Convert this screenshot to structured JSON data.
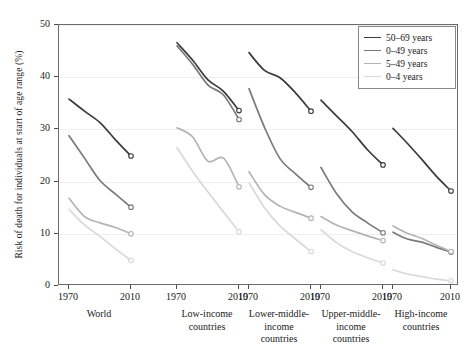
{
  "chart_data": {
    "type": "line",
    "title": "",
    "xlabel": "",
    "ylabel": "Risk of death for individuals at start of age range (%)",
    "ylim": [
      0,
      50
    ],
    "yticks": [
      0,
      10,
      20,
      30,
      40,
      50
    ],
    "ytick_labels": [
      "0",
      "10",
      "20",
      "30",
      "40",
      "50"
    ],
    "grid": true,
    "legend_position": "top-right",
    "x_range_per_group": [
      1970,
      2010
    ],
    "xtick_labels": [
      "1970",
      "2010"
    ],
    "groups": [
      {
        "name": "World",
        "label_lines": [
          "World"
        ],
        "series": [
          {
            "name": "50–69 years",
            "color": "#3b3b3b",
            "x": [
              1970,
              1980,
              1990,
              2000,
              2010
            ],
            "values": [
              35.8,
              33.5,
              31.3,
              28.0,
              24.9
            ]
          },
          {
            "name": "0–49 years",
            "color": "#7a7a7a",
            "x": [
              1970,
              1980,
              1990,
              2000,
              2010
            ],
            "values": [
              28.8,
              24.5,
              20.2,
              17.6,
              15.1
            ]
          },
          {
            "name": "5–49 years",
            "color": "#b4b4b4",
            "x": [
              1970,
              1980,
              1990,
              2000,
              2010
            ],
            "values": [
              16.8,
              13.3,
              12.1,
              11.2,
              10.0
            ]
          },
          {
            "name": "0–4 years",
            "color": "#d9d9d9",
            "x": [
              1970,
              1980,
              1990,
              2000,
              2010
            ],
            "values": [
              14.7,
              11.7,
              9.5,
              7.1,
              4.9
            ]
          }
        ]
      },
      {
        "name": "Low-income countries",
        "label_lines": [
          "Low-income",
          "countries"
        ],
        "series": [
          {
            "name": "50–69 years",
            "color": "#3b3b3b",
            "x": [
              1970,
              1980,
              1990,
              2000,
              2010
            ],
            "values": [
              46.6,
              43.3,
              39.5,
              37.3,
              33.6
            ]
          },
          {
            "name": "0–49 years",
            "color": "#7a7a7a",
            "x": [
              1970,
              1980,
              1990,
              2000,
              2010
            ],
            "values": [
              46.0,
              42.5,
              38.5,
              36.6,
              31.9
            ]
          },
          {
            "name": "5–49 years",
            "color": "#b4b4b4",
            "x": [
              1970,
              1980,
              1990,
              2000,
              2010
            ],
            "values": [
              30.3,
              28.6,
              23.9,
              24.5,
              19.0
            ]
          },
          {
            "name": "0–4 years",
            "color": "#d9d9d9",
            "x": [
              1970,
              1980,
              1990,
              2000,
              2010
            ],
            "values": [
              26.5,
              22.0,
              18.0,
              14.2,
              10.4
            ]
          }
        ]
      },
      {
        "name": "Lower-middle-income countries",
        "label_lines": [
          "Lower-middle-",
          "income",
          "countries"
        ],
        "series": [
          {
            "name": "50–69 years",
            "color": "#3b3b3b",
            "x": [
              1970,
              1980,
              1990,
              2000,
              2010
            ],
            "values": [
              44.7,
              41.3,
              39.9,
              37.0,
              33.5
            ]
          },
          {
            "name": "0–49 years",
            "color": "#7a7a7a",
            "x": [
              1970,
              1980,
              1990,
              2000,
              2010
            ],
            "values": [
              37.8,
              30.4,
              24.4,
              21.5,
              18.9
            ]
          },
          {
            "name": "5–49 years",
            "color": "#b4b4b4",
            "x": [
              1970,
              1980,
              1990,
              2000,
              2010
            ],
            "values": [
              21.9,
              17.5,
              15.3,
              14.1,
              13.0
            ]
          },
          {
            "name": "0–4 years",
            "color": "#d9d9d9",
            "x": [
              1970,
              1980,
              1990,
              2000,
              2010
            ],
            "values": [
              19.8,
              15.0,
              11.5,
              9.0,
              6.6
            ]
          }
        ]
      },
      {
        "name": "Upper-middle-income countries",
        "label_lines": [
          "Upper-middle-",
          "income",
          "countries"
        ],
        "series": [
          {
            "name": "50–69 years",
            "color": "#3b3b3b",
            "x": [
              1970,
              1980,
              1990,
              2000,
              2010
            ],
            "values": [
              35.6,
              32.6,
              29.6,
              26.1,
              23.2
            ]
          },
          {
            "name": "0–49 years",
            "color": "#7a7a7a",
            "x": [
              1970,
              1980,
              1990,
              2000,
              2010
            ],
            "values": [
              22.7,
              17.7,
              14.2,
              12.1,
              10.2
            ]
          },
          {
            "name": "5–49 years",
            "color": "#b4b4b4",
            "x": [
              1970,
              1980,
              1990,
              2000,
              2010
            ],
            "values": [
              13.3,
              11.7,
              10.6,
              9.6,
              8.7
            ]
          },
          {
            "name": "0–4 years",
            "color": "#d9d9d9",
            "x": [
              1970,
              1980,
              1990,
              2000,
              2010
            ],
            "values": [
              10.8,
              8.3,
              6.6,
              5.4,
              4.4
            ]
          }
        ]
      },
      {
        "name": "High-income countries",
        "label_lines": [
          "High-income",
          "countries"
        ],
        "series": [
          {
            "name": "50–69 years",
            "color": "#3b3b3b",
            "x": [
              1970,
              1980,
              1990,
              2000,
              2010
            ],
            "values": [
              30.2,
              27.3,
              24.2,
              21.0,
              18.2
            ]
          },
          {
            "name": "0–49 years",
            "color": "#7a7a7a",
            "x": [
              1970,
              1980,
              1990,
              2000,
              2010
            ],
            "values": [
              10.3,
              9.0,
              8.4,
              7.4,
              6.5
            ]
          },
          {
            "name": "5–49 years",
            "color": "#b4b4b4",
            "x": [
              1970,
              1980,
              1990,
              2000,
              2010
            ],
            "values": [
              11.5,
              10.1,
              9.1,
              7.8,
              6.6
            ]
          },
          {
            "name": "0–4 years",
            "color": "#d9d9d9",
            "x": [
              1970,
              1980,
              1990,
              2000,
              2010
            ],
            "values": [
              3.1,
              2.3,
              1.8,
              1.3,
              1.0
            ]
          }
        ]
      }
    ],
    "legend": [
      {
        "label": "50–69 years",
        "color": "#3b3b3b"
      },
      {
        "label": "0–49 years",
        "color": "#7a7a7a"
      },
      {
        "label": "5–49 years",
        "color": "#b4b4b4"
      },
      {
        "label": "0–4 years",
        "color": "#d9d9d9"
      }
    ]
  }
}
